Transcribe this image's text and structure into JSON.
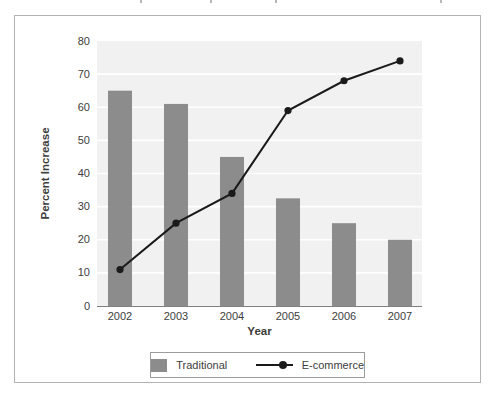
{
  "chart_data": {
    "type": "bar+line",
    "categories": [
      "2002",
      "2003",
      "2004",
      "2005",
      "2006",
      "2007"
    ],
    "series": [
      {
        "name": "Traditional",
        "type": "bar",
        "color": "#8c8c8c",
        "values": [
          65,
          61,
          45,
          32.5,
          25,
          20
        ]
      },
      {
        "name": "E-commerce",
        "type": "line",
        "color": "#1a1a1a",
        "values": [
          11,
          25,
          34,
          59,
          68,
          74
        ]
      }
    ],
    "title": "",
    "xlabel": "Year",
    "ylabel": "Percent Increase",
    "ylim": [
      0,
      80
    ],
    "ytick_step": 10,
    "grid": true,
    "legend_position": "bottom"
  },
  "colors": {
    "plot_bg": "#f1f1f1",
    "gridline": "#ffffff",
    "axis_line": "#808080",
    "tick_text": "#3d3d3d",
    "frame_border": "#b3b3b3",
    "legend_border": "#9c9c9c"
  }
}
